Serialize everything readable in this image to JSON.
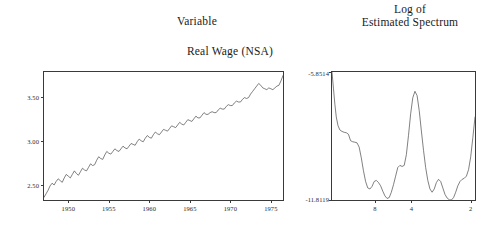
{
  "headings": {
    "left_title": "Variable",
    "right_title_line1": "Log of",
    "right_title_line2": "Estimated Spectrum",
    "left_subtitle": "Real Wage (NSA)"
  },
  "colors": {
    "line": "#4a4a4a",
    "frame": "#3a3a3a",
    "text": "#1a1a1a",
    "background": "#ffffff"
  },
  "chart_data": [
    {
      "id": "real-wage-series",
      "type": "line",
      "title": "Real Wage (NSA)",
      "panel_title": "Variable",
      "xlabel": "",
      "ylabel": "",
      "grid": false,
      "legend": false,
      "xlim": [
        1947.0,
        1976.5
      ],
      "ylim": [
        2.33,
        3.78
      ],
      "xticks": [
        1950,
        1955,
        1960,
        1965,
        1970,
        1975
      ],
      "xticklabels": [
        "1950",
        "1955",
        "1960",
        "1965",
        "1970",
        "1975"
      ],
      "yticks": [
        2.5,
        3.0,
        3.5
      ],
      "yticklabels": [
        "2.50",
        "3.00",
        "3.50"
      ],
      "x": [
        1947.0,
        1947.25,
        1947.5,
        1947.75,
        1948.0,
        1948.25,
        1948.5,
        1948.75,
        1949.0,
        1949.25,
        1949.5,
        1949.75,
        1950.0,
        1950.25,
        1950.5,
        1950.75,
        1951.0,
        1951.25,
        1951.5,
        1951.75,
        1952.0,
        1952.25,
        1952.5,
        1952.75,
        1953.0,
        1953.25,
        1953.5,
        1953.75,
        1954.0,
        1954.25,
        1954.5,
        1954.75,
        1955.0,
        1955.25,
        1955.5,
        1955.75,
        1956.0,
        1956.25,
        1956.5,
        1956.75,
        1957.0,
        1957.25,
        1957.5,
        1957.75,
        1958.0,
        1958.25,
        1958.5,
        1958.75,
        1959.0,
        1959.25,
        1959.5,
        1959.75,
        1960.0,
        1960.25,
        1960.5,
        1960.75,
        1961.0,
        1961.25,
        1961.5,
        1961.75,
        1962.0,
        1962.25,
        1962.5,
        1962.75,
        1963.0,
        1963.25,
        1963.5,
        1963.75,
        1964.0,
        1964.25,
        1964.5,
        1964.75,
        1965.0,
        1965.25,
        1965.5,
        1965.75,
        1966.0,
        1966.25,
        1966.5,
        1966.75,
        1967.0,
        1967.25,
        1967.5,
        1967.75,
        1968.0,
        1968.25,
        1968.5,
        1968.75,
        1969.0,
        1969.25,
        1969.5,
        1969.75,
        1970.0,
        1970.25,
        1970.5,
        1970.75,
        1971.0,
        1971.25,
        1971.5,
        1971.75,
        1972.0,
        1972.25,
        1972.5,
        1972.75,
        1973.0,
        1973.25,
        1973.5,
        1973.75,
        1974.0,
        1974.25,
        1974.5,
        1974.75,
        1975.0,
        1975.25,
        1975.5,
        1975.75,
        1976.0,
        1976.25,
        1976.5
      ],
      "y": [
        2.36,
        2.4,
        2.44,
        2.49,
        2.52,
        2.5,
        2.54,
        2.57,
        2.55,
        2.53,
        2.58,
        2.62,
        2.6,
        2.58,
        2.62,
        2.66,
        2.63,
        2.61,
        2.65,
        2.69,
        2.67,
        2.66,
        2.7,
        2.74,
        2.72,
        2.73,
        2.78,
        2.82,
        2.8,
        2.79,
        2.84,
        2.88,
        2.86,
        2.85,
        2.88,
        2.91,
        2.89,
        2.88,
        2.91,
        2.94,
        2.92,
        2.91,
        2.94,
        2.97,
        2.96,
        2.95,
        2.99,
        3.02,
        3.0,
        2.99,
        3.03,
        3.06,
        3.04,
        3.03,
        3.07,
        3.1,
        3.08,
        3.07,
        3.1,
        3.13,
        3.12,
        3.11,
        3.14,
        3.17,
        3.16,
        3.15,
        3.18,
        3.21,
        3.19,
        3.18,
        3.21,
        3.24,
        3.23,
        3.22,
        3.25,
        3.28,
        3.26,
        3.26,
        3.29,
        3.32,
        3.3,
        3.3,
        3.32,
        3.33,
        3.32,
        3.32,
        3.35,
        3.37,
        3.36,
        3.36,
        3.39,
        3.41,
        3.4,
        3.4,
        3.43,
        3.45,
        3.44,
        3.44,
        3.47,
        3.49,
        3.48,
        3.49,
        3.53,
        3.56,
        3.59,
        3.62,
        3.65,
        3.63,
        3.6,
        3.59,
        3.58,
        3.6,
        3.59,
        3.58,
        3.6,
        3.62,
        3.63,
        3.68,
        3.74
      ]
    },
    {
      "id": "log-estimated-spectrum",
      "type": "line",
      "title": "Log of Estimated Spectrum",
      "xlabel": "",
      "ylabel": "",
      "grid": false,
      "legend": false,
      "xlim": [
        0.0,
        1.0
      ],
      "ylim": [
        -11.8119,
        -5.8514
      ],
      "ytick_top_label": "-5.8514",
      "ytick_bottom_label": "-11.8119",
      "xticks": [
        0.3,
        0.555,
        0.97
      ],
      "xticklabels": [
        "8",
        "4",
        "2"
      ],
      "x": [
        0.0,
        0.01,
        0.02,
        0.03,
        0.042,
        0.055,
        0.07,
        0.085,
        0.1,
        0.115,
        0.13,
        0.145,
        0.16,
        0.175,
        0.19,
        0.205,
        0.22,
        0.235,
        0.25,
        0.265,
        0.28,
        0.295,
        0.31,
        0.325,
        0.34,
        0.355,
        0.37,
        0.385,
        0.4,
        0.415,
        0.43,
        0.445,
        0.46,
        0.475,
        0.49,
        0.505,
        0.52,
        0.535,
        0.55,
        0.565,
        0.58,
        0.595,
        0.61,
        0.625,
        0.64,
        0.655,
        0.67,
        0.685,
        0.7,
        0.715,
        0.73,
        0.745,
        0.76,
        0.775,
        0.79,
        0.805,
        0.82,
        0.835,
        0.85,
        0.865,
        0.88,
        0.895,
        0.91,
        0.925,
        0.94,
        0.955,
        0.97,
        0.985,
        1.0
      ],
      "y": [
        -5.8514,
        -6.6,
        -7.35,
        -7.95,
        -8.35,
        -8.55,
        -8.62,
        -8.66,
        -8.68,
        -8.75,
        -9.05,
        -9.1,
        -9.12,
        -9.15,
        -9.35,
        -9.85,
        -10.45,
        -10.95,
        -11.25,
        -11.3,
        -11.18,
        -10.95,
        -10.9,
        -11.0,
        -11.15,
        -11.4,
        -11.62,
        -11.74,
        -11.7,
        -11.45,
        -11.1,
        -10.7,
        -10.3,
        -10.2,
        -10.25,
        -10.2,
        -9.7,
        -8.8,
        -7.8,
        -7.05,
        -6.75,
        -6.95,
        -7.65,
        -8.6,
        -9.5,
        -10.3,
        -10.9,
        -11.3,
        -11.45,
        -11.3,
        -11.0,
        -10.85,
        -10.95,
        -11.25,
        -11.55,
        -11.72,
        -11.8,
        -11.81,
        -11.7,
        -11.45,
        -11.15,
        -10.95,
        -10.85,
        -10.8,
        -10.7,
        -10.4,
        -9.8,
        -8.9,
        -7.95,
        -7.45
      ]
    }
  ]
}
